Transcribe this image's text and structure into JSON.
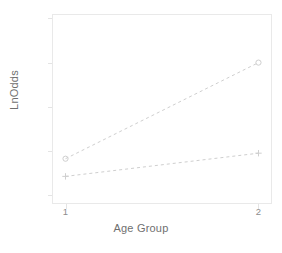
{
  "chart_data": {
    "type": "line",
    "title": "",
    "xlabel": "Age Group",
    "ylabel": "LnOdds",
    "x": [
      1,
      2
    ],
    "xticklabels": [
      "1",
      "2"
    ],
    "xlim": [
      0.93,
      2.07
    ],
    "ylim": [
      -3.88,
      -2.16
    ],
    "yticks": [
      -2.2,
      -2.6,
      -3.0,
      -3.4,
      -3.8
    ],
    "yticklabels": [
      "-2.2",
      "-2.6",
      "-3.0",
      "-3.4",
      "-3.8"
    ],
    "grid": false,
    "legend": "none",
    "linestyle": "dashed",
    "series": [
      {
        "name": "upper",
        "marker": "circle",
        "color": "#cfcfcf",
        "values": [
          -3.47,
          -2.6
        ]
      },
      {
        "name": "lower",
        "marker": "plus",
        "color": "#cfcfcf",
        "values": [
          -3.63,
          -3.42
        ]
      }
    ]
  },
  "figure": {
    "title_clipped": "",
    "axis": {
      "x_label": "Age Group",
      "y_label": "LnOdds"
    },
    "colors": {
      "frame": "#e9e9e9",
      "line": "#cfcfcf",
      "tick_text": "#8d8d8d",
      "axis_text": "#6f6f6f",
      "background": "#ffffff"
    }
  }
}
